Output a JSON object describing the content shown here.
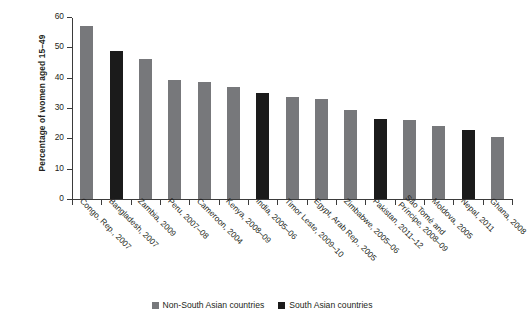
{
  "chart_data": {
    "type": "bar",
    "title": "",
    "xlabel": "",
    "ylabel": "Percentage of women aged 15–49",
    "ylim": [
      0,
      60
    ],
    "ytick_labels": [
      "0",
      "10",
      "20",
      "30",
      "40",
      "50",
      "60"
    ],
    "ytick_values": [
      0,
      10,
      20,
      30,
      40,
      50,
      60
    ],
    "grid": false,
    "legend_position": "bottom-center",
    "categories": [
      "Congo, Rep., 2007",
      "Bangladesh, 2007",
      "Zambia, 2009",
      "Peru, 2007–08",
      "Cameroon, 2004",
      "Kenya, 2008–09",
      "India, 2005–06",
      "Timor Leste, 2009–10",
      "Egypt, Arab Rep., 2005",
      "Zimbabwe, 2005–06",
      "Pakistan, 2011–12",
      "São Tomé and Príncipe, 2008–09",
      "Moldova, 2005",
      "Nepal, 2011",
      "Ghana, 2008"
    ],
    "values": [
      57,
      48.8,
      46.3,
      39.4,
      38.5,
      36.8,
      34.9,
      33.5,
      33.1,
      29.3,
      26.5,
      26.2,
      24,
      22.9,
      20.4
    ],
    "groups": [
      "non-south-asian",
      "south-asian",
      "non-south-asian",
      "non-south-asian",
      "non-south-asian",
      "non-south-asian",
      "south-asian",
      "non-south-asian",
      "non-south-asian",
      "non-south-asian",
      "south-asian",
      "non-south-asian",
      "non-south-asian",
      "south-asian",
      "non-south-asian"
    ],
    "colors": {
      "non-south-asian": "#77787b",
      "south-asian": "#1b1b1b"
    },
    "legend": [
      {
        "label": "Non-South Asian countries",
        "group": "non-south-asian"
      },
      {
        "label": "South Asian countries",
        "group": "south-asian"
      }
    ]
  }
}
